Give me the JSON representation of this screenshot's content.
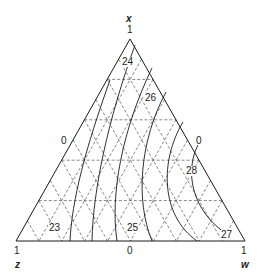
{
  "diagram": {
    "type": "ternary",
    "vertices": {
      "top": {
        "axis": "x",
        "value": "1"
      },
      "bottom_left": {
        "axis": "z",
        "value": "1"
      },
      "bottom_right": {
        "axis": "w",
        "value": "1"
      }
    },
    "edge_zero_labels": {
      "left": "0",
      "right": "0",
      "bottom": "0"
    },
    "grid_divisions": 5,
    "contours": [
      {
        "label": "23"
      },
      {
        "label": "24"
      },
      {
        "label": "25"
      },
      {
        "label": "26"
      },
      {
        "label": "27"
      },
      {
        "label": "28"
      }
    ],
    "colors": {
      "line": "#1a1a1a",
      "grid": "#555555",
      "background": "#ffffff"
    }
  }
}
